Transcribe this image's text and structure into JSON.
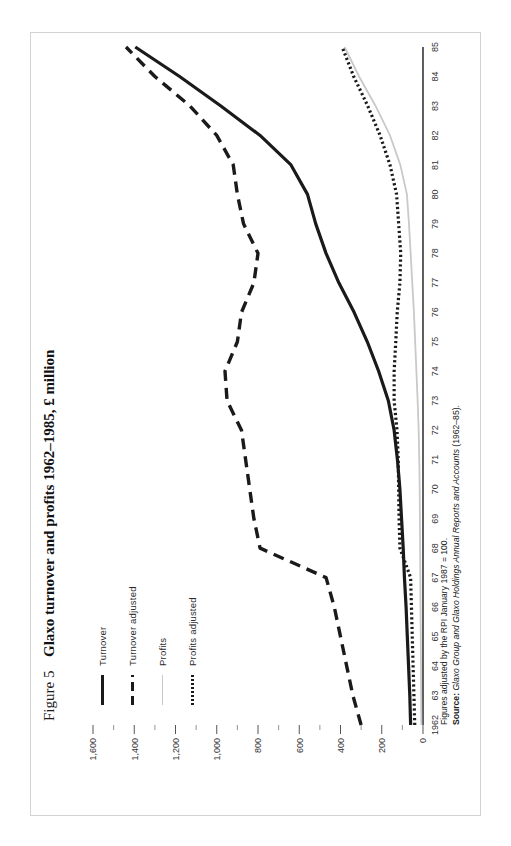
{
  "figure": {
    "number_label": "Figure 5",
    "title": "Glaxo turnover and profits 1962–1985, £ million"
  },
  "legend": {
    "position": "top-left",
    "items": [
      {
        "label": "Turnover",
        "style": "solid",
        "color": "#1a1a1a"
      },
      {
        "label": "Turnover adjusted",
        "style": "dashed",
        "color": "#1a1a1a"
      },
      {
        "label": "Profits",
        "style": "solid-thin",
        "color": "#c9c9c9"
      },
      {
        "label": "Profits adjusted",
        "style": "dotted",
        "color": "#1a1a1a"
      }
    ]
  },
  "notes": {
    "line1": "Figures adjusted by the RPI January 1987 = 100.",
    "source_label": "Source:",
    "source_italic": "Glaxo Group and Glaxo Holdings Annual Reports and Accounts",
    "source_tail": " (1962–85)."
  },
  "chart_data": {
    "type": "line",
    "title": "Glaxo turnover and profits 1962–1985, £ million",
    "xlabel": "",
    "ylabel": "£ million",
    "xlim": [
      1962,
      1985
    ],
    "ylim": [
      0,
      1600
    ],
    "yticks": [
      0,
      200,
      400,
      600,
      800,
      1000,
      1200,
      1400,
      1600
    ],
    "ytick_labels": [
      "0",
      "200",
      "400",
      "600",
      "800",
      "1,000",
      "1,200",
      "1,400",
      "1,600"
    ],
    "y_minor_step": 100,
    "grid": false,
    "legend_position": "upper left",
    "x": [
      1962,
      1963,
      1964,
      1965,
      1966,
      1967,
      1968,
      1969,
      1970,
      1971,
      1972,
      1973,
      1974,
      1975,
      1976,
      1977,
      1978,
      1979,
      1980,
      1981,
      1982,
      1983,
      1984,
      1985
    ],
    "xtick_labels": [
      "1962",
      "63",
      "64",
      "65",
      "66",
      "67",
      "68",
      "69",
      "70",
      "71",
      "72",
      "73",
      "74",
      "75",
      "76",
      "77",
      "78",
      "79",
      "80",
      "81",
      "82",
      "83",
      "84",
      "85"
    ],
    "series": [
      {
        "name": "Turnover",
        "style": "solid",
        "color": "#1a1a1a",
        "values": [
          60,
          64,
          70,
          76,
          82,
          90,
          96,
          104,
          112,
          124,
          140,
          168,
          215,
          270,
          334,
          408,
          470,
          520,
          560,
          640,
          790,
          980,
          1180,
          1395
        ]
      },
      {
        "name": "Turnover adjusted",
        "style": "dashed",
        "color": "#1a1a1a",
        "values": [
          300,
          340,
          370,
          400,
          430,
          470,
          790,
          820,
          840,
          860,
          880,
          950,
          960,
          900,
          880,
          820,
          800,
          870,
          900,
          920,
          1000,
          1130,
          1300,
          1440
        ]
      },
      {
        "name": "Profits",
        "style": "solid-thin",
        "color": "#c9c9c9",
        "values": [
          8,
          9,
          10,
          11,
          12,
          13,
          14,
          15,
          16,
          18,
          21,
          26,
          32,
          38,
          44,
          52,
          60,
          68,
          78,
          110,
          160,
          230,
          310,
          380
        ]
      },
      {
        "name": "Profits adjusted",
        "style": "dotted",
        "color": "#1a1a1a",
        "values": [
          40,
          44,
          48,
          52,
          56,
          60,
          112,
          116,
          118,
          120,
          126,
          140,
          140,
          132,
          125,
          112,
          108,
          118,
          128,
          160,
          208,
          268,
          336,
          392
        ]
      }
    ]
  }
}
